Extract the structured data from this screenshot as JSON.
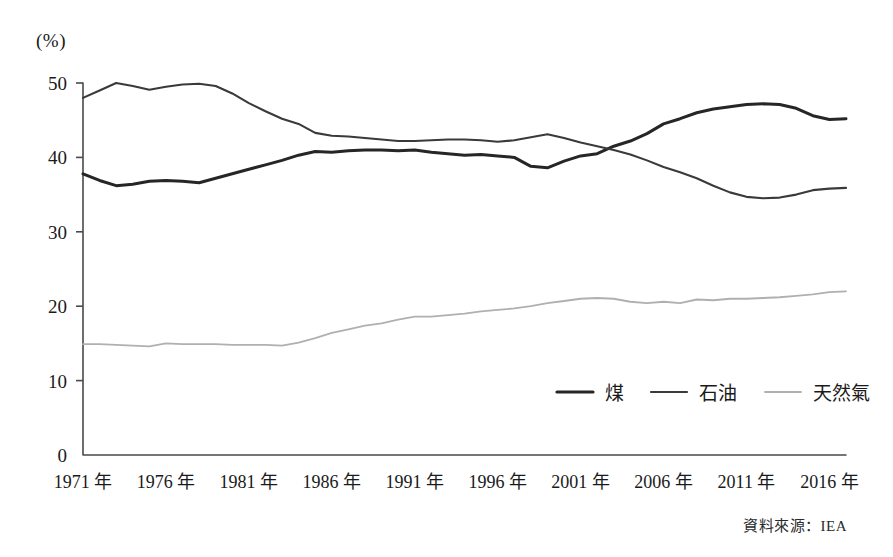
{
  "figure": {
    "unit_label": "(%)",
    "source_note": "資料來源：IEA"
  },
  "legend": {
    "items": [
      {
        "label": "煤",
        "color": "#262626",
        "width": 3.2
      },
      {
        "label": "石油",
        "color": "#3a3a3a",
        "width": 2.2
      },
      {
        "label": "天然氣",
        "color": "#b0b0b0",
        "width": 1.8
      }
    ]
  },
  "chart_data": {
    "type": "line",
    "title": "",
    "subtitle": "",
    "xlabel": "",
    "ylabel": "(%)",
    "xlim": [
      1971,
      2017
    ],
    "ylim": [
      0,
      50
    ],
    "grid": false,
    "legend_position": "inside-bottom-right",
    "ytick_labels": [
      "0",
      "10",
      "20",
      "30",
      "40",
      "50"
    ],
    "ytick_values": [
      0,
      10,
      20,
      30,
      40,
      50
    ],
    "xtick_labels": [
      "1971 年",
      "1976 年",
      "1981 年",
      "1986 年",
      "1991 年",
      "1996 年",
      "2001 年",
      "2006 年",
      "2011 年",
      "2016 年"
    ],
    "xtick_values": [
      1971,
      1976,
      1981,
      1986,
      1991,
      1996,
      2001,
      2006,
      2011,
      2016
    ],
    "x": [
      1971,
      1972,
      1973,
      1974,
      1975,
      1976,
      1977,
      1978,
      1979,
      1980,
      1981,
      1982,
      1983,
      1984,
      1985,
      1986,
      1987,
      1988,
      1989,
      1990,
      1991,
      1992,
      1993,
      1994,
      1995,
      1996,
      1997,
      1998,
      1999,
      2000,
      2001,
      2002,
      2003,
      2004,
      2005,
      2006,
      2007,
      2008,
      2009,
      2010,
      2011,
      2012,
      2013,
      2014,
      2015,
      2016,
      2017
    ],
    "series": [
      {
        "name": "煤",
        "color": "#262626",
        "values": [
          37.8,
          36.9,
          36.2,
          36.4,
          36.8,
          36.9,
          36.8,
          36.6,
          37.2,
          37.8,
          38.4,
          39.0,
          39.6,
          40.3,
          40.8,
          40.7,
          40.9,
          41.0,
          41.0,
          40.9,
          41.0,
          40.7,
          40.5,
          40.3,
          40.4,
          40.2,
          40.0,
          38.8,
          38.6,
          39.5,
          40.2,
          40.5,
          41.5,
          42.2,
          43.2,
          44.5,
          45.2,
          46.0,
          46.5,
          46.8,
          47.1,
          47.2,
          47.1,
          46.6,
          45.6,
          45.1,
          45.2
        ],
        "linewidth": 3.0
      },
      {
        "name": "石油",
        "color": "#3a3a3a",
        "values": [
          48.0,
          49.0,
          50.0,
          49.6,
          49.1,
          49.5,
          49.8,
          49.9,
          49.6,
          48.6,
          47.3,
          46.2,
          45.2,
          44.5,
          43.3,
          42.9,
          42.8,
          42.6,
          42.4,
          42.2,
          42.2,
          42.3,
          42.4,
          42.4,
          42.3,
          42.1,
          42.3,
          42.7,
          43.1,
          42.6,
          42.0,
          41.5,
          41.0,
          40.4,
          39.6,
          38.7,
          38.0,
          37.2,
          36.2,
          35.3,
          34.7,
          34.5,
          34.6,
          35.0,
          35.6,
          35.8,
          35.9
        ],
        "linewidth": 2.1
      },
      {
        "name": "天然氣",
        "color": "#b0b0b0",
        "values": [
          14.9,
          14.9,
          14.8,
          14.7,
          14.6,
          15.0,
          14.9,
          14.9,
          14.9,
          14.8,
          14.8,
          14.8,
          14.7,
          15.1,
          15.7,
          16.4,
          16.9,
          17.4,
          17.7,
          18.2,
          18.6,
          18.6,
          18.8,
          19.0,
          19.3,
          19.5,
          19.7,
          20.0,
          20.4,
          20.7,
          21.0,
          21.1,
          21.0,
          20.6,
          20.4,
          20.6,
          20.4,
          20.9,
          20.8,
          21.0,
          21.0,
          21.1,
          21.2,
          21.4,
          21.6,
          21.9,
          22.0
        ],
        "linewidth": 1.8
      }
    ]
  }
}
